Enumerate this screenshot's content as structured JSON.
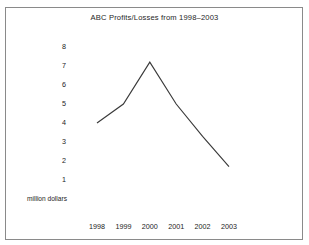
{
  "chart_data": {
    "type": "line",
    "title": "ABC Profits/Losses from 1998–2003",
    "xlabel": "",
    "ylabel": "million dollars",
    "categories": [
      "1998",
      "1999",
      "2000",
      "2001",
      "2002",
      "2003"
    ],
    "x": [
      1998,
      1999,
      2000,
      2001,
      2002,
      2003
    ],
    "values": [
      4.0,
      5.0,
      7.2,
      5.0,
      3.3,
      1.7
    ],
    "series": [
      {
        "name": "ABC Profits/Losses",
        "values": [
          4.0,
          5.0,
          7.2,
          5.0,
          3.3,
          1.7
        ]
      }
    ],
    "ylim": [
      0,
      8.6
    ],
    "xlim": [
      1997.6,
      2003.6
    ],
    "ytick_labels": [
      "8",
      "7",
      "6",
      "5",
      "4",
      "3",
      "2",
      "1"
    ],
    "ytick_values": [
      8,
      7,
      6,
      5,
      4,
      3,
      2,
      1
    ],
    "xtick_labels": [
      "1998",
      "1999",
      "2000",
      "2001",
      "2002",
      "2003"
    ],
    "grid": false,
    "legend": "none",
    "axis_lines": false,
    "line_color": "#3a3a3a",
    "markers": false,
    "annotations": []
  },
  "figure": {
    "title": "ABC Profits/Losses from 1998–2003",
    "y_axis_caption": "million dollars",
    "border_color": "#8a8a8a",
    "background_color": "#ffffff",
    "text_color": "#1c1c1c"
  },
  "axes": {
    "y_ticks": [
      {
        "label": "8",
        "value": 8
      },
      {
        "label": "7",
        "value": 7
      },
      {
        "label": "6",
        "value": 6
      },
      {
        "label": "5",
        "value": 5
      },
      {
        "label": "4",
        "value": 4
      },
      {
        "label": "3",
        "value": 3
      },
      {
        "label": "2",
        "value": 2
      },
      {
        "label": "1",
        "value": 1
      }
    ],
    "x_ticks": [
      {
        "label": "1998",
        "value": 1998
      },
      {
        "label": "1999",
        "value": 1999
      },
      {
        "label": "2000",
        "value": 2000
      },
      {
        "label": "2001",
        "value": 2001
      },
      {
        "label": "2002",
        "value": 2002
      },
      {
        "label": "2003",
        "value": 2003
      }
    ]
  }
}
